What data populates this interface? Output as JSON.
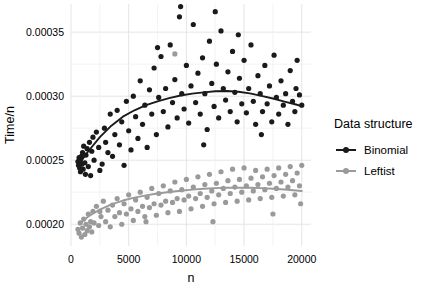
{
  "chart_data": {
    "type": "scatter",
    "title": "",
    "xlabel": "n",
    "ylabel": "Time/n",
    "xlim": [
      0,
      20800
    ],
    "ylim": [
      0.000183,
      0.000372
    ],
    "xticks": [
      0,
      5000,
      10000,
      15000,
      20000
    ],
    "xtick_labels": [
      "0",
      "5000",
      "10000",
      "15000",
      "20000"
    ],
    "yticks": [
      0.0002,
      0.00025,
      0.0003,
      0.00035
    ],
    "ytick_labels": [
      "0.00020",
      "0.00025",
      "0.00030",
      "0.00035"
    ],
    "grid": true,
    "legend": {
      "title": "Data structure",
      "position": "right",
      "entries": [
        {
          "name": "Binomial",
          "color": "#1a1a1a"
        },
        {
          "name": "Leftist",
          "color": "#9a9a9a"
        }
      ]
    },
    "series": [
      {
        "name": "Binomial",
        "color": "#1a1a1a",
        "points": [
          [
            600,
            0.000249
          ],
          [
            650,
            0.000246
          ],
          [
            700,
            0.000252
          ],
          [
            750,
            0.000244
          ],
          [
            800,
            0.00025
          ],
          [
            820,
            0.000241
          ],
          [
            900,
            0.000253
          ],
          [
            950,
            0.000247
          ],
          [
            1000,
            0.000256
          ],
          [
            1050,
            0.000243
          ],
          [
            1100,
            0.000261
          ],
          [
            1200,
            0.000248
          ],
          [
            1250,
            0.000239
          ],
          [
            1300,
            0.000254
          ],
          [
            1400,
            0.000259
          ],
          [
            1500,
            0.000245
          ],
          [
            1600,
            0.000264
          ],
          [
            1700,
            0.000238
          ],
          [
            1800,
            0.000257
          ],
          [
            1900,
            0.000268
          ],
          [
            2000,
            0.00025
          ],
          [
            2200,
            0.000272
          ],
          [
            2400,
            0.00026
          ],
          [
            2500,
            0.000242
          ],
          [
            2700,
            0.000247
          ],
          [
            2900,
            0.000275
          ],
          [
            3000,
            0.000264
          ],
          [
            3200,
            0.000256
          ],
          [
            3400,
            0.000286
          ],
          [
            3600,
            0.000253
          ],
          [
            3800,
            0.00027
          ],
          [
            4000,
            0.000289
          ],
          [
            4200,
            0.000262
          ],
          [
            4400,
            0.00028
          ],
          [
            4600,
            0.000246
          ],
          [
            4800,
            0.000296
          ],
          [
            5000,
            0.000273
          ],
          [
            5200,
            0.000258
          ],
          [
            5400,
            0.0003
          ],
          [
            5600,
            0.000284
          ],
          [
            5800,
            0.000267
          ],
          [
            6000,
            0.000312
          ],
          [
            6200,
            0.000278
          ],
          [
            6400,
            0.000293
          ],
          [
            6600,
            0.00026
          ],
          [
            6800,
            0.000305
          ],
          [
            7000,
            0.000286
          ],
          [
            7200,
            0.000322
          ],
          [
            7400,
            0.00027
          ],
          [
            7600,
            0.000299
          ],
          [
            7800,
            0.000331
          ],
          [
            8000,
            0.000288
          ],
          [
            8200,
            0.000306
          ],
          [
            8400,
            0.000276
          ],
          [
            8600,
            0.00034
          ],
          [
            8800,
            0.000295
          ],
          [
            9000,
            0.000313
          ],
          [
            9200,
            0.000283
          ],
          [
            9400,
            0.000362
          ],
          [
            9600,
            0.000302
          ],
          [
            9800,
            0.00029
          ],
          [
            10000,
            0.000324
          ],
          [
            10200,
            0.000279
          ],
          [
            10400,
            0.000308
          ],
          [
            10600,
            0.000356
          ],
          [
            10800,
            0.000295
          ],
          [
            11000,
            0.000318
          ],
          [
            11200,
            0.000286
          ],
          [
            11400,
            0.00033
          ],
          [
            11600,
            0.000302
          ],
          [
            11800,
            0.000274
          ],
          [
            12000,
            0.000343
          ],
          [
            12200,
            0.00031
          ],
          [
            12400,
            0.000292
          ],
          [
            12600,
            0.000325
          ],
          [
            12800,
            0.000283
          ],
          [
            13000,
            0.000351
          ],
          [
            13200,
            0.000306
          ],
          [
            13400,
            0.000297
          ],
          [
            13600,
            0.000319
          ],
          [
            13800,
            0.000288
          ],
          [
            14000,
            0.000335
          ],
          [
            14200,
            0.000303
          ],
          [
            14400,
            0.00028
          ],
          [
            14600,
            0.000314
          ],
          [
            14800,
            0.000294
          ],
          [
            15000,
            0.000328
          ],
          [
            15200,
            0.000287
          ],
          [
            15400,
            0.000306
          ],
          [
            15600,
            0.00034
          ],
          [
            15800,
            0.000296
          ],
          [
            16000,
            0.000278
          ],
          [
            16200,
            0.000316
          ],
          [
            16400,
            0.000302
          ],
          [
            16600,
            0.000288
          ],
          [
            16800,
            0.000324
          ],
          [
            17000,
            0.000294
          ],
          [
            17200,
            0.000308
          ],
          [
            17400,
            0.00028
          ],
          [
            17600,
            0.000332
          ],
          [
            17800,
            0.000299
          ],
          [
            18000,
            0.000286
          ],
          [
            18200,
            0.000312
          ],
          [
            18400,
            0.000293
          ],
          [
            18600,
            0.000302
          ],
          [
            18800,
            0.000278
          ],
          [
            19000,
            0.00032
          ],
          [
            19200,
            0.000296
          ],
          [
            19400,
            0.000288
          ],
          [
            19600,
            0.000328
          ],
          [
            19800,
            0.000301
          ],
          [
            20000,
            0.000293
          ],
          [
            9500,
            0.00037
          ],
          [
            12500,
            0.000366
          ],
          [
            14500,
            0.000348
          ],
          [
            7500,
            0.000338
          ],
          [
            11500,
            0.000262
          ],
          [
            16500,
            0.00027
          ],
          [
            19500,
            0.000306
          ]
        ]
      },
      {
        "name": "Leftist",
        "color": "#9a9a9a",
        "points": [
          [
            600,
            0.000196
          ],
          [
            700,
            0.000193
          ],
          [
            800,
            0.000201
          ],
          [
            900,
            0.00019
          ],
          [
            1000,
            0.000197
          ],
          [
            1100,
            0.000204
          ],
          [
            1200,
            0.000192
          ],
          [
            1300,
            0.0002
          ],
          [
            1400,
            0.000195
          ],
          [
            1500,
            0.000208
          ],
          [
            1600,
            0.000198
          ],
          [
            1700,
            0.000202
          ],
          [
            1800,
            0.000194
          ],
          [
            1900,
            0.00021
          ],
          [
            2000,
            0.000201
          ],
          [
            2200,
            0.000214
          ],
          [
            2400,
            0.000199
          ],
          [
            2600,
            0.000206
          ],
          [
            2800,
            0.000218
          ],
          [
            3000,
            0.000202
          ],
          [
            3200,
            0.000211
          ],
          [
            3400,
            0.000198
          ],
          [
            3600,
            0.000215
          ],
          [
            3800,
            0.000206
          ],
          [
            4000,
            0.00022
          ],
          [
            4200,
            0.000209
          ],
          [
            4400,
            0.0002
          ],
          [
            4600,
            0.000216
          ],
          [
            4800,
            0.000208
          ],
          [
            5000,
            0.000223
          ],
          [
            5200,
            0.000212
          ],
          [
            5400,
            0.000203
          ],
          [
            5600,
            0.000219
          ],
          [
            5800,
            0.00021
          ],
          [
            6000,
            0.000225
          ],
          [
            6200,
            0.000214
          ],
          [
            6400,
            0.000206
          ],
          [
            6600,
            0.000221
          ],
          [
            6800,
            0.000213
          ],
          [
            7000,
            0.000228
          ],
          [
            7200,
            0.000216
          ],
          [
            7400,
            0.000207
          ],
          [
            7600,
            0.000224
          ],
          [
            7800,
            0.000215
          ],
          [
            8000,
            0.00023
          ],
          [
            8200,
            0.000218
          ],
          [
            8400,
            0.000209
          ],
          [
            8600,
            0.000226
          ],
          [
            8800,
            0.000217
          ],
          [
            9000,
            0.000233
          ],
          [
            9200,
            0.00022
          ],
          [
            9400,
            0.00021
          ],
          [
            9600,
            0.000227
          ],
          [
            9800,
            0.000219
          ],
          [
            10000,
            0.000235
          ],
          [
            10200,
            0.000222
          ],
          [
            10400,
            0.000212
          ],
          [
            10600,
            0.000229
          ],
          [
            10800,
            0.00022
          ],
          [
            11000,
            0.000237
          ],
          [
            11200,
            0.000224
          ],
          [
            11400,
            0.000214
          ],
          [
            11600,
            0.000231
          ],
          [
            11800,
            0.000221
          ],
          [
            12000,
            0.000239
          ],
          [
            12200,
            0.000226
          ],
          [
            12400,
            0.000216
          ],
          [
            12600,
            0.000232
          ],
          [
            12800,
            0.000223
          ],
          [
            13000,
            0.000241
          ],
          [
            13200,
            0.000228
          ],
          [
            13400,
            0.000217
          ],
          [
            13600,
            0.000234
          ],
          [
            13800,
            0.000224
          ],
          [
            14000,
            0.000243
          ],
          [
            14200,
            0.000229
          ],
          [
            14400,
            0.000218
          ],
          [
            14600,
            0.000235
          ],
          [
            14800,
            0.000225
          ],
          [
            15000,
            0.000244
          ],
          [
            15200,
            0.00023
          ],
          [
            15400,
            0.000219
          ],
          [
            15600,
            0.000236
          ],
          [
            15800,
            0.000226
          ],
          [
            16000,
            0.000242
          ],
          [
            16200,
            0.000231
          ],
          [
            16400,
            0.00022
          ],
          [
            16600,
            0.000237
          ],
          [
            16800,
            0.000227
          ],
          [
            17000,
            0.000243
          ],
          [
            17200,
            0.000232
          ],
          [
            17400,
            0.000221
          ],
          [
            17600,
            0.000238
          ],
          [
            17800,
            0.000228
          ],
          [
            18000,
            0.000244
          ],
          [
            18200,
            0.000233
          ],
          [
            18400,
            0.000222
          ],
          [
            18600,
            0.000239
          ],
          [
            18800,
            0.000229
          ],
          [
            19000,
            0.000245
          ],
          [
            19200,
            0.000234
          ],
          [
            19400,
            0.000223
          ],
          [
            19600,
            0.00024
          ],
          [
            19800,
            0.00023
          ],
          [
            20000,
            0.000246
          ],
          [
            9000,
            0.000333
          ],
          [
            2500,
            0.00021
          ],
          [
            6500,
            0.000202
          ],
          [
            12300,
            0.000202
          ],
          [
            17500,
            0.000208
          ],
          [
            19900,
            0.000216
          ]
        ]
      }
    ],
    "trend_lines": [
      {
        "name": "Binomial",
        "color": "#1a1a1a",
        "points": [
          [
            700,
            0.000247
          ],
          [
            1500,
            0.000257
          ],
          [
            2500,
            0.000268
          ],
          [
            3500,
            0.000277
          ],
          [
            4500,
            0.000284
          ],
          [
            5500,
            0.000289
          ],
          [
            6500,
            0.000293
          ],
          [
            7500,
            0.000296
          ],
          [
            8500,
            0.0002985
          ],
          [
            9500,
            0.0003005
          ],
          [
            10500,
            0.000302
          ],
          [
            11500,
            0.000303
          ],
          [
            12500,
            0.0003038
          ],
          [
            13500,
            0.000304
          ],
          [
            14500,
            0.0003035
          ],
          [
            15500,
            0.0003022
          ],
          [
            16500,
            0.0003003
          ],
          [
            17500,
            0.0002982
          ],
          [
            18500,
            0.0002958
          ],
          [
            19500,
            0.0002935
          ],
          [
            20000,
            0.0002922
          ]
        ]
      },
      {
        "name": "Leftist",
        "color": "#9a9a9a",
        "points": [
          [
            700,
            0.0002
          ],
          [
            1500,
            0.000206
          ],
          [
            2500,
            0.0002115
          ],
          [
            3500,
            0.0002155
          ],
          [
            4500,
            0.0002185
          ],
          [
            5500,
            0.0002208
          ],
          [
            6500,
            0.0002225
          ],
          [
            7500,
            0.000224
          ],
          [
            8500,
            0.0002252
          ],
          [
            9500,
            0.0002262
          ],
          [
            10500,
            0.000227
          ],
          [
            11500,
            0.0002277
          ],
          [
            12500,
            0.0002282
          ],
          [
            13500,
            0.0002285
          ],
          [
            14500,
            0.0002286
          ],
          [
            15500,
            0.0002285
          ],
          [
            16500,
            0.0002282
          ],
          [
            17500,
            0.0002277
          ],
          [
            18500,
            0.0002271
          ],
          [
            19500,
            0.0002264
          ],
          [
            20000,
            0.000226
          ]
        ]
      }
    ]
  },
  "style": {
    "grid_color": "#e2e2e2",
    "background": "#ffffff",
    "text_color": "#000000"
  }
}
